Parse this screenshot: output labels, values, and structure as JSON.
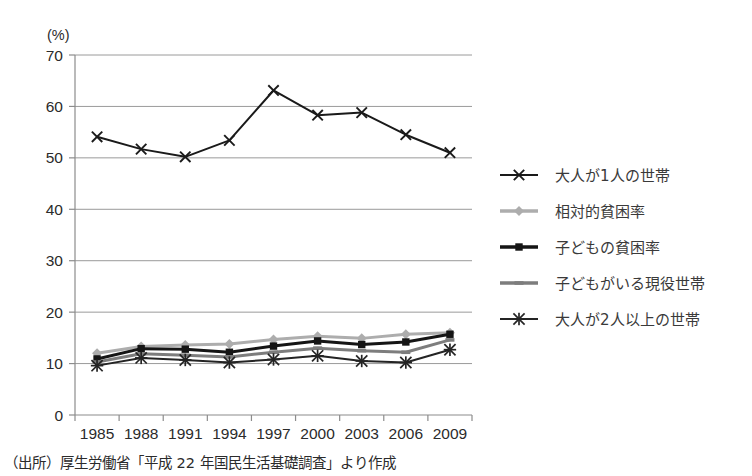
{
  "chart_data": {
    "type": "line",
    "title": "",
    "xlabel": "",
    "ylabel": "",
    "yunit": "(%)",
    "categories": [
      "1985",
      "1988",
      "1991",
      "1994",
      "1997",
      "2000",
      "2003",
      "2006",
      "2009"
    ],
    "yticks": [
      0,
      10,
      20,
      30,
      40,
      50,
      60,
      70
    ],
    "ylim": [
      0,
      70
    ],
    "grid": true,
    "legend_position": "right",
    "series": [
      {
        "name": "大人が1人の世帯",
        "marker": "x",
        "color": "#1a1a1a",
        "values": [
          54.1,
          51.7,
          50.2,
          53.4,
          63.1,
          58.3,
          58.8,
          54.5,
          51.0
        ]
      },
      {
        "name": "相対的貧困率",
        "marker": "diamond",
        "color": "#adadad",
        "values": [
          12.0,
          13.3,
          13.6,
          13.8,
          14.7,
          15.3,
          14.9,
          15.7,
          16.0
        ]
      },
      {
        "name": "子どもの貧困率",
        "marker": "square",
        "color": "#151515",
        "values": [
          10.9,
          12.9,
          12.8,
          12.2,
          13.4,
          14.4,
          13.7,
          14.2,
          15.7
        ]
      },
      {
        "name": "子どもがいる現役世帯",
        "marker": "dash",
        "color": "#7d7d7d",
        "values": [
          10.3,
          11.9,
          11.6,
          11.3,
          12.2,
          13.0,
          12.5,
          12.2,
          14.6
        ]
      },
      {
        "name": "大人が2人以上の世帯",
        "marker": "star",
        "color": "#242424",
        "values": [
          9.6,
          11.1,
          10.7,
          10.2,
          10.8,
          11.5,
          10.5,
          10.2,
          12.7
        ]
      }
    ]
  },
  "caption": {
    "source_text": "（出所）厚生労働省「平成 22 年国民生活基礎調査」より作成"
  }
}
